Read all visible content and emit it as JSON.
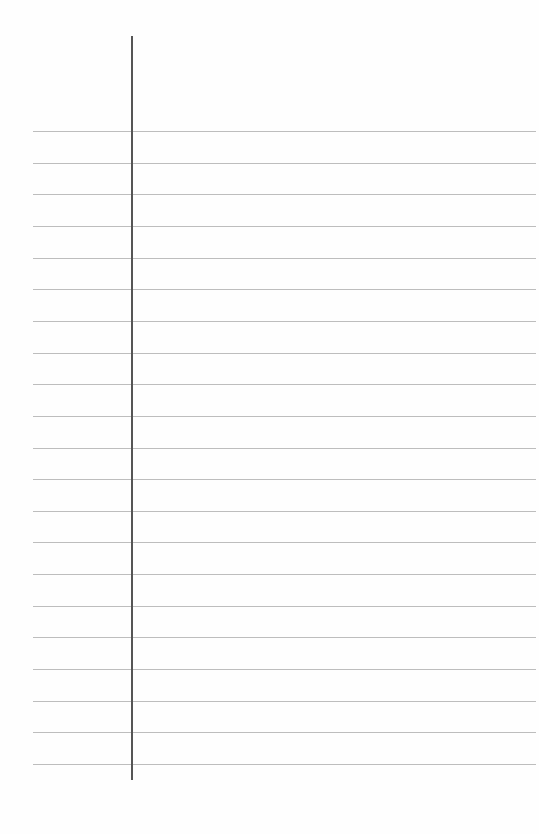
{
  "page": {
    "type": "lined-paper",
    "background_color": "#fefefe",
    "rule_color": "#bdbdbd",
    "margin_line_color": "#555555",
    "rule_count": 21,
    "rule_start_y": 131,
    "rule_spacing": 31.65,
    "margin_line_x": 131,
    "text": ""
  }
}
